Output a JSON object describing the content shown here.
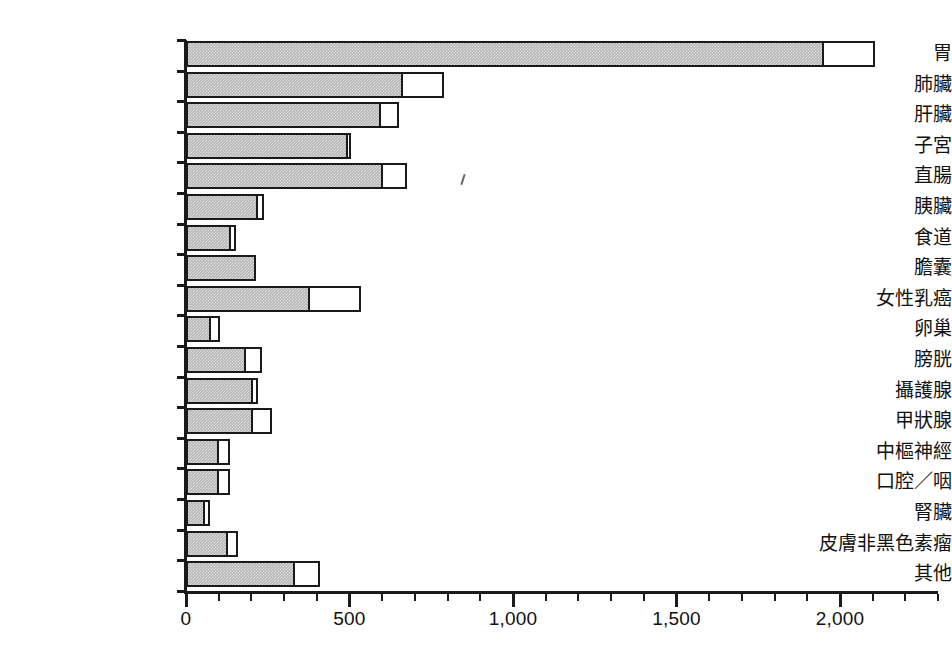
{
  "chart_data": {
    "type": "bar",
    "orientation": "horizontal",
    "stacked": true,
    "title": "",
    "subtitle": "",
    "xlabel": "",
    "ylabel": "",
    "xlim": [
      0,
      2300
    ],
    "xticks": [
      0,
      500,
      1000,
      1500,
      2000
    ],
    "xtick_labels": [
      "0",
      "500",
      "1,000",
      "1,500",
      "2,000"
    ],
    "minor_tick_step": 100,
    "grid": false,
    "legend": null,
    "categories": [
      "胃",
      "肺臟",
      "肝臟",
      "子宮",
      "直腸",
      "胰臟",
      "食道",
      "膽囊",
      "女性乳癌",
      "卵巢",
      "膀胱",
      "攝護腺",
      "甲狀腺",
      "中樞神經",
      "口腔／咽",
      "腎臟",
      "皮膚非黑色素瘤",
      "其他"
    ],
    "series": [
      {
        "name": "gray",
        "color": "#b4b4b4",
        "values": [
          1951,
          663,
          595,
          494,
          601,
          221,
          138,
          215,
          380,
          77,
          184,
          206,
          206,
          101,
          101,
          58,
          129,
          334
        ]
      },
      {
        "name": "white",
        "color": "#ffffff",
        "values": [
          156,
          125,
          55,
          12,
          74,
          18,
          15,
          0,
          156,
          28,
          49,
          15,
          58,
          34,
          34,
          15,
          31,
          77
        ]
      }
    ],
    "totals": [
      2107,
      788,
      650,
      506,
      675,
      239,
      153,
      215,
      536,
      105,
      233,
      221,
      264,
      135,
      135,
      73,
      160,
      411
    ]
  },
  "axis": {
    "tick_labels": [
      "0",
      "500",
      "1,000",
      "1,500",
      "2,000"
    ]
  }
}
